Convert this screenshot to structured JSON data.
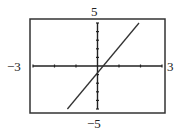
{
  "chart_data": {
    "type": "line",
    "title": "",
    "xlabel": "",
    "ylabel": "",
    "xlim": [
      -3,
      3
    ],
    "ylim": [
      -5,
      5
    ],
    "x_tick_labels": {
      "min": "−3",
      "max": "3"
    },
    "y_tick_labels": {
      "min": "−5",
      "max": "5"
    },
    "x_ticks": [
      -3,
      -2,
      -1,
      0,
      1,
      2,
      3
    ],
    "y_ticks": [
      -5,
      -4,
      -3,
      -2,
      -1,
      0,
      1,
      2,
      3,
      4,
      5
    ],
    "grid": false,
    "legend": null,
    "series": [
      {
        "name": "line",
        "equation_estimate": "y ≈ 3x − 0.8",
        "x": [
          -1.4,
          1.93
        ],
        "y": [
          -5,
          5
        ],
        "color": "#333333"
      }
    ],
    "annotations": {
      "x_intercept": 0.27,
      "y_intercept": -0.8
    }
  },
  "labels": {
    "ymax": "5",
    "ymin": "−5",
    "xmin": "−3",
    "xmax": "3"
  },
  "colors": {
    "frame": "#333333",
    "axes": "#222222",
    "line": "#333333",
    "background": "#ffffff"
  }
}
